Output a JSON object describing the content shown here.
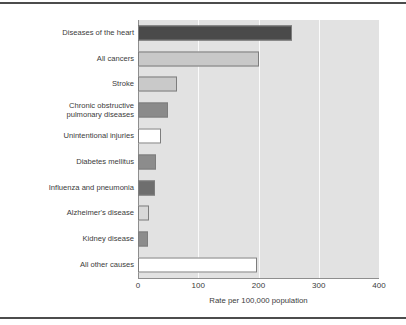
{
  "chart_data": {
    "type": "bar",
    "orientation": "horizontal",
    "title": "",
    "xlabel": "Rate per 100,000 population",
    "ylabel": "",
    "xlim": [
      0,
      400
    ],
    "xticks": [
      0,
      100,
      200,
      300,
      400
    ],
    "grid": "vertical white gridlines at 100, 200, 300",
    "legend": "none",
    "plot_background": "#e2e2e2",
    "categories": [
      "Diseases of the heart",
      "All cancers",
      "Stroke",
      "Chronic obstructive\npulmonary diseases",
      "Unintentional injuries",
      "Diabetes mellitus",
      "Influenza and pneumonia",
      "Alzheimer's disease",
      "Kidney disease",
      "All other causes"
    ],
    "values": [
      256,
      201,
      65,
      50,
      38,
      30,
      28,
      19,
      17,
      198
    ],
    "bar_colors": [
      "#4a4a4a",
      "#c8c8c8",
      "#c9c9c9",
      "#8a8a8a",
      "#ffffff",
      "#8c8c8c",
      "#6e6e6e",
      "#d8d8d8",
      "#8c8c8c",
      "#ffffff"
    ],
    "bar_border_color": "#7d7d7d"
  },
  "axis": {
    "tick_labels": [
      "0",
      "100",
      "200",
      "300",
      "400"
    ],
    "title": "Rate per 100,000 population"
  },
  "frame": {
    "rule_color": "#4c4c4c"
  }
}
